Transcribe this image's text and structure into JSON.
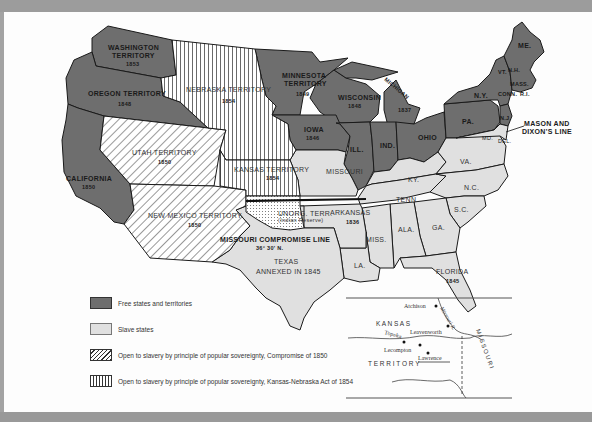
{
  "map": {
    "regions": {
      "washington": {
        "name": "WASHINGTON",
        "sub": "TERRITORY",
        "year": "1853"
      },
      "oregon": {
        "name": "OREGON  TERRITORY",
        "year": "1848"
      },
      "nebraska": {
        "name": "NEBRASKA  TERRITORY",
        "year": "1854"
      },
      "minnesota": {
        "name": "MINNESOTA",
        "sub": "TERRITORY",
        "year": "1849"
      },
      "wisconsin": {
        "name": "WISCONSIN",
        "year": "1848"
      },
      "michigan": {
        "name": "MICHIGAN",
        "year": "1837"
      },
      "iowa": {
        "name": "IOWA",
        "year": "1846"
      },
      "illinois": {
        "name": "ILL."
      },
      "indiana": {
        "name": "IND."
      },
      "ohio": {
        "name": "OHIO"
      },
      "pennsylvania": {
        "name": "PA."
      },
      "new_york": {
        "name": "N.Y."
      },
      "maine": {
        "name": "ME."
      },
      "vermont": {
        "name": "VT."
      },
      "new_hampshire": {
        "name": "N.H."
      },
      "massachusetts": {
        "name": "MASS."
      },
      "connecticut": {
        "name": "CONN."
      },
      "rhode_island": {
        "name": "R.I."
      },
      "new_jersey": {
        "name": "N.J."
      },
      "maryland": {
        "name": "MD."
      },
      "delaware": {
        "name": "DEL."
      },
      "california": {
        "name": "CALIFORNIA",
        "year": "1850"
      },
      "utah": {
        "name": "UTAH  TERRITORY",
        "year": "1850"
      },
      "new_mexico": {
        "name": "NEW  MEXICO  TERRITORY",
        "year": "1850"
      },
      "kansas": {
        "name": "KANSAS  TERRITORY",
        "year": "1854"
      },
      "missouri": {
        "name": "MISSOURI"
      },
      "unorg": {
        "name": "UNORG. TERR.",
        "sub": "(Indian Reserve)"
      },
      "arkansas": {
        "name": "ARKANSAS",
        "year": "1836"
      },
      "texas": {
        "name": "TEXAS",
        "sub": "ANNEXED IN  1845"
      },
      "louisiana": {
        "name": "LA."
      },
      "mississippi": {
        "name": "MISS."
      },
      "alabama": {
        "name": "ALA."
      },
      "georgia": {
        "name": "GA."
      },
      "florida": {
        "name": "FLORIDA",
        "year": "1845"
      },
      "south_carolina": {
        "name": "S.C."
      },
      "north_carolina": {
        "name": "N.C."
      },
      "tennessee": {
        "name": "TENN."
      },
      "kentucky": {
        "name": "KY."
      },
      "virginia": {
        "name": "VA."
      }
    },
    "annotations": {
      "mason_dixon_1": "MASON AND",
      "mason_dixon_2": "DIXON'S LINE",
      "missouri_compromise_1": "MISSOURI  COMPROMISE  LINE",
      "missouri_compromise_2": "36° 30' N."
    },
    "colors": {
      "free": "#6e6e6e",
      "slave": "#e0e0e0",
      "outline": "#1a1a1a",
      "paper": "#fdfdfd",
      "frame": "#a3a3a3"
    }
  },
  "legend": {
    "items": [
      {
        "pattern": "solid-dark",
        "label": "Free states and territories"
      },
      {
        "pattern": "solid-light",
        "label": "Slave states"
      },
      {
        "pattern": "diagonal-hatch",
        "label": "Open to slavery by principle of popular sovereignty,  Compromise of 1850"
      },
      {
        "pattern": "vertical-hatch",
        "label": "Open to slavery by principle of popular sovereignty, Kansas-Nebraska Act of 1854"
      }
    ]
  },
  "inset": {
    "title_region_1": "K A N S A S",
    "title_region_2": "T E R R I T O R Y",
    "state_label": "M I S S O U R I",
    "river_label": "Missouri R.",
    "towns": [
      "Atchison",
      "Leavenworth",
      "Topeka",
      "Lecompton",
      "Lawrence"
    ]
  }
}
